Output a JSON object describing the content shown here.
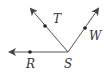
{
  "diagram": {
    "type": "rays-from-vertex",
    "vertex": {
      "label": "S",
      "x": 68,
      "y": 52,
      "label_x": 64,
      "label_y": 68
    },
    "rays": [
      {
        "name": "ray-SR",
        "to_x": 10,
        "to_y": 52,
        "point": {
          "label": "R",
          "x": 30,
          "y": 52,
          "label_x": 26,
          "label_y": 68
        }
      },
      {
        "name": "ray-ST",
        "to_x": 31,
        "to_y": 9,
        "point": {
          "label": "T",
          "x": 45,
          "y": 26,
          "label_x": 53,
          "label_y": 23
        }
      },
      {
        "name": "ray-SW",
        "to_x": 98,
        "to_y": 9,
        "point": {
          "label": "W",
          "x": 85,
          "y": 28,
          "label_x": 89,
          "label_y": 40
        }
      }
    ],
    "colors": {
      "line": "#555555",
      "text": "#333333"
    }
  }
}
